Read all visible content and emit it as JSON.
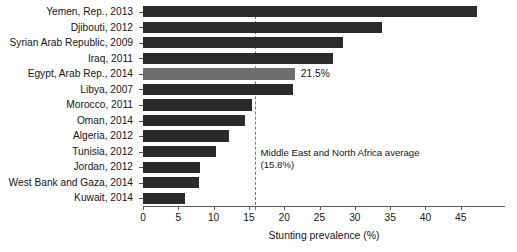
{
  "chart_data": {
    "type": "bar",
    "orientation": "horizontal",
    "title": "",
    "xlabel": "Stunting prevalence (%)",
    "ylabel": "",
    "xlim": [
      0,
      49
    ],
    "xticks": [
      0,
      5,
      10,
      15,
      20,
      25,
      30,
      35,
      40,
      45
    ],
    "grid": false,
    "legend": null,
    "categories": [
      "Yemen, Rep., 2013",
      "Djibouti, 2012",
      "Syrian Arab Republic, 2009",
      "Iraq, 2011",
      "Egypt, Arab Rep., 2014",
      "Libya, 2007",
      "Morocco, 2011",
      "Oman, 2014",
      "Algeria, 2012",
      "Tunisia, 2012",
      "Jordan, 2012",
      "West Bank and Gaza, 2014",
      "Kuwait, 2014"
    ],
    "values": [
      47.3,
      33.9,
      28.3,
      26.9,
      21.5,
      21.3,
      15.4,
      14.5,
      12.2,
      10.4,
      8.1,
      7.9,
      5.9
    ],
    "highlight_index": 4,
    "point_labels": [
      "",
      "",
      "",
      "",
      "21.5%",
      "",
      "",
      "",
      "",
      "",
      "",
      "",
      ""
    ],
    "bar_color": "#2b2b2b",
    "highlight_color": "#6e6e6e",
    "reference_line": {
      "value": 15.8,
      "style": "dashed",
      "color": "#777777",
      "annotation_line1": "Middle East and North Africa average",
      "annotation_line2": "(15.8%)"
    }
  }
}
